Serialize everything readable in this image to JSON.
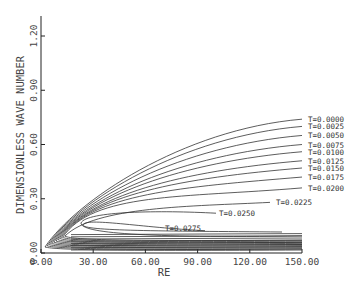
{
  "chart_data": {
    "type": "line",
    "title": "",
    "xlabel": "RE",
    "ylabel": "DIMENSIONLESS WAVE NUMBER",
    "xlim": [
      0,
      150
    ],
    "ylim": [
      0,
      1.2
    ],
    "x_ticks": [
      "0.00",
      "30.00",
      "60.00",
      "90.00",
      "120.00",
      "150.00"
    ],
    "y_ticks": [
      "0.00",
      "0.30",
      "0.60",
      "0.90",
      "1.20"
    ],
    "grid": false,
    "legend": "inline curve labels at right end",
    "series": [
      {
        "name": "T=0.0000",
        "upper_end_y": 0.74
      },
      {
        "name": "T=0.0025",
        "upper_end_y": 0.7
      },
      {
        "name": "T=0.0050",
        "upper_end_y": 0.65
      },
      {
        "name": "T=0.0075",
        "upper_end_y": 0.6
      },
      {
        "name": "T=0.0100",
        "upper_end_y": 0.56
      },
      {
        "name": "T=0.0125",
        "upper_end_y": 0.51
      },
      {
        "name": "T=0.0150",
        "upper_end_y": 0.47
      },
      {
        "name": "T=0.0175",
        "upper_end_y": 0.42
      },
      {
        "name": "T=0.0200",
        "upper_end_y": 0.36
      },
      {
        "name": "T=0.0225",
        "upper_end_y": 0.28
      },
      {
        "name": "T=0.0250",
        "upper_end_y": 0.22
      },
      {
        "name": "T=0.0275",
        "upper_end_y": 0.14
      }
    ]
  }
}
